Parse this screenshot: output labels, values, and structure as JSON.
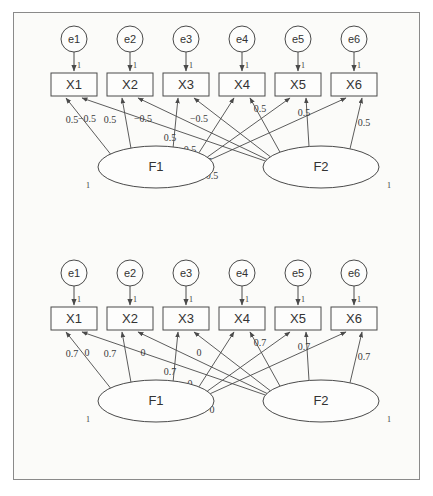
{
  "figure": {
    "border_color": "#8a8a8a",
    "line_color": "#4a4a4a",
    "background": "#fbfbf9"
  },
  "panels": [
    {
      "id": "top-panel",
      "errors": [
        "e1",
        "e2",
        "e3",
        "e4",
        "e5",
        "e6"
      ],
      "indicators": [
        "X1",
        "X2",
        "X3",
        "X4",
        "X5",
        "X6"
      ],
      "factors": [
        "F1",
        "F2"
      ],
      "error_loading": "1",
      "factor_variance": "1",
      "f1_labels": [
        "0.5",
        "0.5",
        "0.5",
        "0.5",
        "0.5",
        "0.5"
      ],
      "f2_labels": [
        "−0.5",
        "−0.5",
        "−0.5",
        "0.5",
        "0.5",
        "0.5"
      ],
      "f1_values": [
        0.5,
        0.5,
        0.5,
        0.5,
        0.5,
        0.5
      ],
      "f2_values": [
        -0.5,
        -0.5,
        -0.5,
        0.5,
        0.5,
        0.5
      ]
    },
    {
      "id": "bottom-panel",
      "errors": [
        "e1",
        "e2",
        "e3",
        "e4",
        "e5",
        "e6"
      ],
      "indicators": [
        "X1",
        "X2",
        "X3",
        "X4",
        "X5",
        "X6"
      ],
      "factors": [
        "F1",
        "F2"
      ],
      "error_loading": "1",
      "factor_variance": "1",
      "f1_labels": [
        "0.7",
        "0.7",
        "0.7",
        "0",
        "0",
        "0"
      ],
      "f2_labels": [
        "0",
        "0",
        "0",
        "0.7",
        "0.7",
        "0.7"
      ],
      "f1_values": [
        0.7,
        0.7,
        0.7,
        0,
        0,
        0
      ],
      "f2_values": [
        0,
        0,
        0,
        0.7,
        0.7,
        0.7
      ]
    }
  ]
}
